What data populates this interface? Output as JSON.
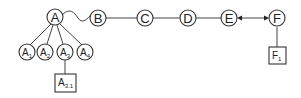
{
  "diagram": {
    "main_chain": [
      {
        "id": "A",
        "label": "A"
      },
      {
        "id": "B",
        "label": "B"
      },
      {
        "id": "C",
        "label": "C"
      },
      {
        "id": "D",
        "label": "D"
      },
      {
        "id": "E",
        "label": "E"
      },
      {
        "id": "F",
        "label": "F"
      }
    ],
    "children_of_A": [
      {
        "base": "A",
        "sub": "1"
      },
      {
        "base": "A",
        "sub": "2"
      },
      {
        "base": "A",
        "sub": "3"
      },
      {
        "base": "A",
        "sub": "4"
      }
    ],
    "child_of_A3": {
      "base": "A",
      "sub": "3.1"
    },
    "child_of_F": {
      "base": "F",
      "sub": "1"
    },
    "edges": [
      {
        "from": "A",
        "to": "B",
        "style": "wavy"
      },
      {
        "from": "B",
        "to": "C",
        "style": "line"
      },
      {
        "from": "C",
        "to": "D",
        "style": "line"
      },
      {
        "from": "D",
        "to": "E",
        "style": "line"
      },
      {
        "from": "E",
        "to": "F",
        "style": "double-arrow"
      },
      {
        "from": "A",
        "to": "A1"
      },
      {
        "from": "A",
        "to": "A2"
      },
      {
        "from": "A",
        "to": "A3"
      },
      {
        "from": "A",
        "to": "A4"
      },
      {
        "from": "A3",
        "to": "A3.1"
      },
      {
        "from": "F",
        "to": "F1"
      }
    ]
  }
}
